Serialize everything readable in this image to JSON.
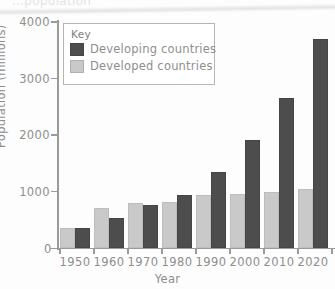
{
  "top_caption": "...population",
  "legend": {
    "title": "Key",
    "entries": [
      {
        "label": "Developing countries",
        "color": "#4d4d4d",
        "key": "developing"
      },
      {
        "label": "Developed countries",
        "color": "#c9c9c9",
        "key": "developed"
      }
    ]
  },
  "chart_data": {
    "type": "bar",
    "title": "",
    "xlabel": "Year",
    "ylabel": "Population (millions)",
    "categories": [
      "1950",
      "1960",
      "1970",
      "1980",
      "1990",
      "2000",
      "2010",
      "2020"
    ],
    "series": [
      {
        "name": "Developed countries",
        "color": "#c9c9c9",
        "values": [
          350,
          710,
          800,
          820,
          930,
          950,
          1000,
          1050
        ]
      },
      {
        "name": "Developing countries",
        "color": "#4d4d4d",
        "values": [
          350,
          530,
          760,
          940,
          1350,
          1910,
          2660,
          3700
        ]
      }
    ],
    "ylim": [
      0,
      4000
    ],
    "yticks": [
      0,
      1000,
      2000,
      3000,
      4000
    ],
    "ytick_labels": [
      "0",
      "1000",
      "2000",
      "3000",
      "4000"
    ],
    "grid": false,
    "legend_position": "upper-left",
    "axis_color": "#9a9a9a",
    "text_color": "#8e8e8e"
  }
}
